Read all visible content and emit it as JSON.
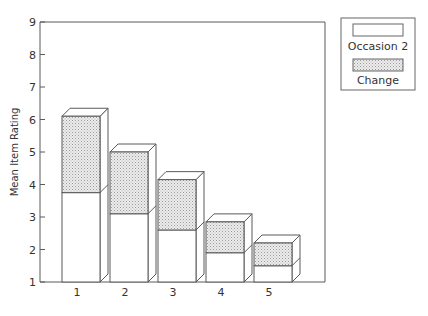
{
  "chart_data": {
    "type": "bar",
    "subtype": "stacked-3d",
    "title": "",
    "xlabel": "",
    "ylabel": "Mean Item Rating",
    "ylim": [
      1,
      9
    ],
    "yticks": [
      1,
      2,
      3,
      4,
      5,
      6,
      7,
      8,
      9
    ],
    "categories": [
      "1",
      "2",
      "3",
      "4",
      "5"
    ],
    "series": [
      {
        "name": "Occasion 2",
        "values": [
          3.75,
          3.1,
          2.6,
          1.9,
          1.5
        ],
        "fill": "#ffffff"
      },
      {
        "name": "Change",
        "values": [
          2.35,
          1.9,
          1.55,
          0.95,
          0.7
        ],
        "fill": "#d8d8d8"
      }
    ],
    "totals": [
      6.1,
      5.0,
      4.15,
      2.85,
      2.2
    ],
    "grid": false,
    "legend_position": "top-right outside"
  },
  "legend": {
    "items": [
      {
        "label": "Occasion 2",
        "pattern": "plain"
      },
      {
        "label": "Change",
        "pattern": "dotted"
      }
    ]
  },
  "axis": {
    "y_title": "Mean Item Rating"
  },
  "colors": {
    "line": "#555555",
    "change_fill": "#d8d8d8",
    "occasion_fill": "#ffffff"
  }
}
